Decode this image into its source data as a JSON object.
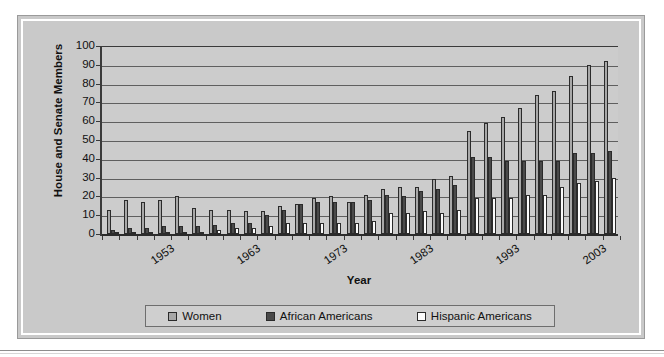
{
  "chart_data": {
    "type": "bar",
    "title": "",
    "xlabel": "Year",
    "ylabel": "House and Senate Members",
    "ylim": [
      0,
      100
    ],
    "ytick_step": 10,
    "yticks": [
      100,
      90,
      80,
      70,
      60,
      50,
      40,
      30,
      20,
      10,
      0
    ],
    "grid": true,
    "legend_position": "bottom",
    "categories": [
      "1951",
      "1953",
      "1955",
      "1957",
      "1959",
      "1961",
      "1963",
      "1965",
      "1967",
      "1969",
      "1971",
      "1973",
      "1975",
      "1977",
      "1979",
      "1981",
      "1983",
      "1985",
      "1987",
      "1989",
      "1991",
      "1993",
      "1995",
      "1997",
      "1999",
      "2001",
      "2003",
      "2005",
      "2007",
      "2009"
    ],
    "xtick_labels": [
      "1953",
      "1963",
      "1973",
      "1983",
      "1993",
      "2003"
    ],
    "xtick_category_index": [
      1,
      6,
      11,
      16,
      21,
      26
    ],
    "series": [
      {
        "name": "Women",
        "color": "#a8a8a8",
        "values": [
          13,
          18,
          17,
          18,
          20,
          14,
          13,
          13,
          12,
          12,
          15,
          16,
          19,
          20,
          17,
          21,
          24,
          25,
          25,
          29,
          31,
          55,
          59,
          62,
          67,
          74,
          76,
          84,
          90,
          92
        ]
      },
      {
        "name": "African Americans",
        "color": "#4a4a4a",
        "values": [
          2,
          3,
          3,
          4,
          4,
          4,
          5,
          6,
          6,
          10,
          13,
          16,
          17,
          17,
          17,
          18,
          21,
          20,
          23,
          24,
          26,
          41,
          41,
          39,
          39,
          39,
          39,
          43,
          43,
          44
        ]
      },
      {
        "name": "Hispanic Americans",
        "color": "#fbfbfb",
        "values": [
          1,
          1,
          1,
          1,
          1,
          1,
          2,
          3,
          3,
          4,
          6,
          6,
          6,
          6,
          6,
          7,
          11,
          11,
          12,
          11,
          13,
          19,
          19,
          19,
          21,
          21,
          25,
          27,
          28,
          30
        ]
      }
    ]
  },
  "axis": {
    "y_title": "House and Senate Members",
    "x_title": "Year"
  },
  "legend": {
    "items": [
      {
        "label": "Women",
        "swatch": "women"
      },
      {
        "label": "African Americans",
        "swatch": "african"
      },
      {
        "label": "Hispanic Americans",
        "swatch": "hispanic"
      }
    ]
  }
}
